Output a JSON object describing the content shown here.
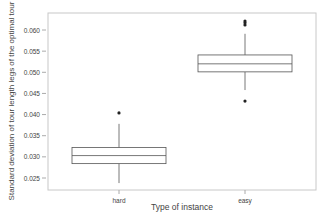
{
  "chart_data": {
    "type": "boxplot",
    "title": "",
    "xlabel": "Type of instance",
    "ylabel": "Standard deviation of tour length legs of the optimal tour",
    "categories": [
      "hard",
      "easy"
    ],
    "ylim": [
      0.0225,
      0.0635
    ],
    "yticks": [
      0.025,
      0.03,
      0.035,
      0.04,
      0.045,
      0.05,
      0.055,
      0.06
    ],
    "ytick_labels": [
      "0.025",
      "0.030",
      "0.035",
      "0.040",
      "0.045",
      "0.050",
      "0.055",
      "0.060"
    ],
    "grid": false,
    "legend": null,
    "series": [
      {
        "name": "hard",
        "whisker_low": 0.0238,
        "q1": 0.0284,
        "median": 0.0303,
        "q3": 0.0322,
        "whisker_high": 0.0378,
        "outliers": [
          0.0404
        ]
      },
      {
        "name": "easy",
        "whisker_low": 0.0458,
        "q1": 0.0501,
        "median": 0.052,
        "q3": 0.0541,
        "whisker_high": 0.0591,
        "outliers": [
          0.0432,
          0.0612,
          0.0617,
          0.0621
        ]
      }
    ]
  },
  "colors": {
    "frame": "#c8c8c8",
    "box": "#555555",
    "outlier": "#222222",
    "text": "#444444"
  }
}
